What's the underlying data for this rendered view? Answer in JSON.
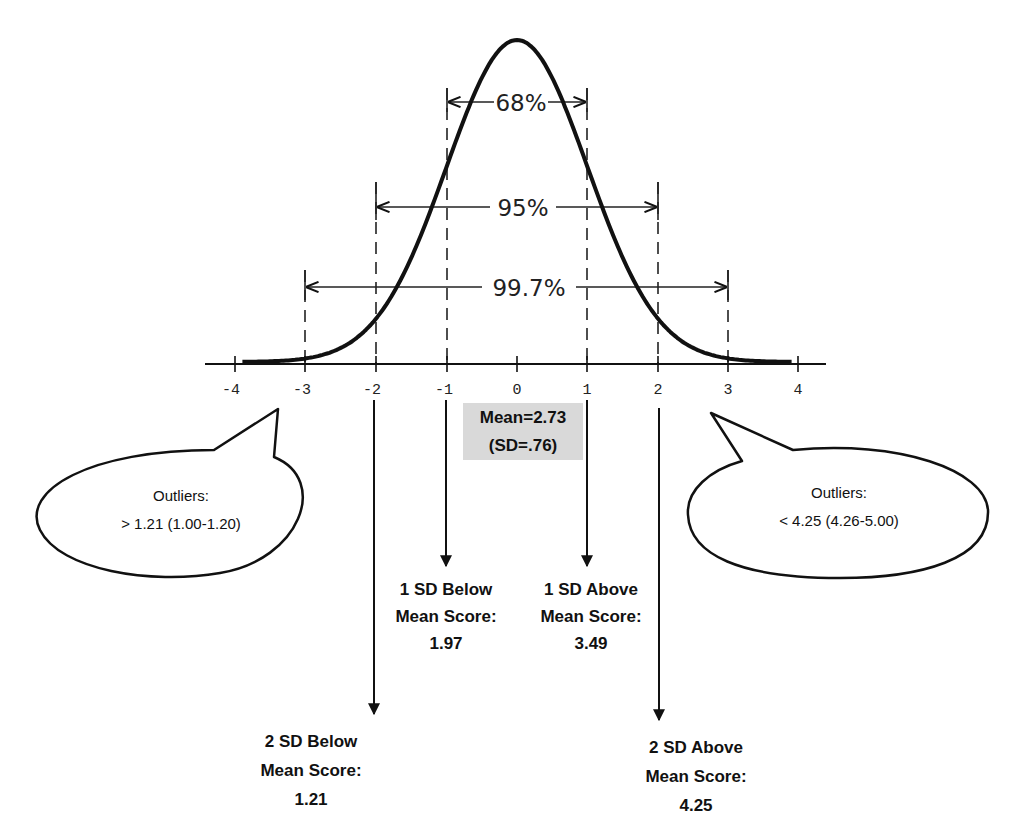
{
  "chart_data": {
    "type": "line",
    "title": "",
    "xlabel": "",
    "ylabel": "",
    "x_ticks": [
      -4,
      -3,
      -2,
      -1,
      0,
      1,
      2,
      3,
      4
    ],
    "xlim": [
      -4.4,
      4.4
    ],
    "grid": false,
    "series": [
      {
        "name": "normal curve",
        "mean": 0,
        "sd": 1
      }
    ],
    "intervals": [
      {
        "label": "68%",
        "from": -1,
        "to": 1
      },
      {
        "label": "95%",
        "from": -2,
        "to": 2
      },
      {
        "label": "99.7%",
        "from": -3,
        "to": 3
      }
    ]
  },
  "axis": {
    "tick_labels": [
      "-4",
      "-3",
      "-2",
      "-1",
      "0",
      "1",
      "2",
      "3",
      "4"
    ]
  },
  "intervals": {
    "p68": "68%",
    "p95": "95%",
    "p997": "99.7%"
  },
  "mean_box": {
    "line1": "Mean=2.73",
    "line2": "(SD=.76)",
    "bg_color": "#d9d9d9"
  },
  "callouts": {
    "left": {
      "title": "Outliers:",
      "value": "> 1.21 (1.00-1.20)"
    },
    "right": {
      "title": "Outliers:",
      "value": "< 4.25 (4.26-5.00)"
    }
  },
  "sd_labels": {
    "minus1": {
      "line1": "1 SD Below",
      "line2": "Mean Score:",
      "value": "1.97"
    },
    "plus1": {
      "line1": "1 SD Above",
      "line2": "Mean Score:",
      "value": "3.49"
    },
    "minus2": {
      "line1": "2 SD Below",
      "line2": "Mean Score:",
      "value": "1.21"
    },
    "plus2": {
      "line1": "2 SD Above",
      "line2": "Mean Score:",
      "value": "4.25"
    }
  }
}
